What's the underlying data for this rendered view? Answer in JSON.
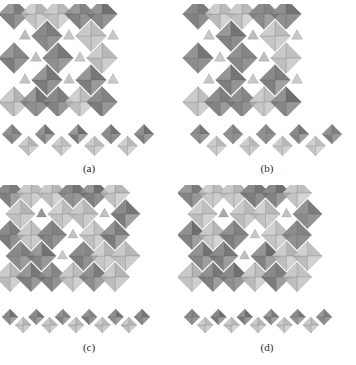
{
  "figure": {
    "background_color": "#ffffff",
    "panel_count": 4
  },
  "palette": {
    "dark_gray": "#6e6e6e",
    "mid_gray": "#8a8a8a",
    "light_gray": "#b4b4b4",
    "pale_gray": "#c9c9c9",
    "edge_gray": "#5a5a5a",
    "background": "#ffffff",
    "caption_color": "#2a2a2a"
  },
  "panels": [
    {
      "id": "a",
      "caption": "(a)",
      "top_view_name": "octahedral-framework-top-view",
      "side_view_name": "octahedral-chain-side-view",
      "lattice": {
        "cols": 5,
        "rows": 5,
        "cell": 22,
        "origin_x": 14,
        "origin_y": 10,
        "void_pattern": "checkerboard",
        "corner_sharing": true
      },
      "chain": {
        "units": 9,
        "amplitude": 13,
        "period": 30,
        "origin_x": 12,
        "origin_y": 22,
        "style": "zigzag-tall"
      }
    },
    {
      "id": "b",
      "caption": "(b)",
      "top_view_name": "octahedral-framework-top-view",
      "side_view_name": "octahedral-chain-side-view",
      "lattice": {
        "cols": 5,
        "rows": 5,
        "cell": 22,
        "origin_x": 20,
        "origin_y": 10,
        "void_pattern": "checkerboard-wide",
        "corner_sharing": true
      },
      "chain": {
        "units": 9,
        "amplitude": 13,
        "period": 30,
        "origin_x": 22,
        "origin_y": 22,
        "style": "zigzag-tall"
      }
    },
    {
      "id": "c",
      "caption": "(c)",
      "top_view_name": "octahedral-framework-top-view",
      "side_view_name": "octahedral-chain-side-view",
      "lattice": {
        "cols": 6,
        "rows": 5,
        "cell": 21,
        "origin_x": 10,
        "origin_y": 8,
        "void_pattern": "dense-edge-sharing",
        "corner_sharing": false
      },
      "chain": {
        "units": 11,
        "amplitude": 9,
        "period": 24,
        "origin_x": 10,
        "origin_y": 20,
        "style": "zigzag-flat"
      }
    },
    {
      "id": "d",
      "caption": "(d)",
      "top_view_name": "octahedral-framework-top-view",
      "side_view_name": "octahedral-chain-side-view",
      "lattice": {
        "cols": 6,
        "rows": 5,
        "cell": 21,
        "origin_x": 14,
        "origin_y": 8,
        "void_pattern": "dense-edge-sharing",
        "corner_sharing": false
      },
      "chain": {
        "units": 11,
        "amplitude": 9,
        "period": 24,
        "origin_x": 14,
        "origin_y": 20,
        "style": "zigzag-flat"
      }
    }
  ]
}
